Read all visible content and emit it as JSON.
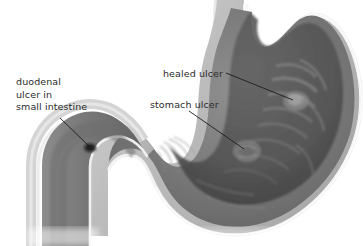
{
  "figure": {
    "palette": {
      "background": "#ffffff",
      "outer_wall": "#b9b9b9",
      "inner_rim": "#f2f2f2",
      "mucosa_light": "#9a9a9a",
      "mucosa_mid": "#787878",
      "lumen_dark": "#5a5a5a",
      "lumen_deep": "#3f3f3f",
      "ulcer_crater": "#2a2a2a",
      "leader_line": "#1c1c1c",
      "text": "#2b2b2b"
    },
    "labels": [
      {
        "id": "duodenal",
        "lines": [
          "duodenal",
          "ulcer in",
          "small intestine"
        ],
        "text": "duodenal\nulcer in\nsmall intestine",
        "leader": {
          "x1": 60,
          "y1": 118,
          "x2": 89,
          "y2": 146
        }
      },
      {
        "id": "healed",
        "text": "healed ulcer",
        "leader": {
          "x1": 226,
          "y1": 73,
          "x2": 293,
          "y2": 100
        }
      },
      {
        "id": "stomach",
        "text": "stomach ulcer",
        "leader": {
          "x1": 189,
          "y1": 111,
          "x2": 244,
          "y2": 149
        }
      }
    ],
    "features": [
      {
        "name": "esophagus",
        "note": "tube entering at top"
      },
      {
        "name": "fundus",
        "note": "upper dome of stomach"
      },
      {
        "name": "body",
        "note": "main stomach chamber with rugae"
      },
      {
        "name": "greater-curvature",
        "note": "right outer curve"
      },
      {
        "name": "lesser-curvature",
        "note": "left inner curve"
      },
      {
        "name": "pylorus",
        "note": "narrow junction to duodenum"
      },
      {
        "name": "duodenum",
        "note": "C-shaped small intestine segment at left"
      },
      {
        "name": "healed-ulcer-site",
        "note": "pale scar on upper right mucosa"
      },
      {
        "name": "stomach-ulcer-site",
        "note": "eroded patch mid stomach wall"
      },
      {
        "name": "duodenal-ulcer-site",
        "note": "dark crater in duodenum"
      }
    ]
  }
}
